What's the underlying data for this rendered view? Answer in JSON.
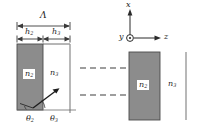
{
  "figure": {
    "colors": {
      "grating_fill": "#8c8c8c",
      "grating_stroke": "#4a4a4a",
      "line": "#3a3a3a",
      "text": "#1c1c1c",
      "background": "#ffffff"
    },
    "dimensions": {
      "period_label": "Λ",
      "ridge_thickness_label": "h",
      "ridge_thickness_sub": "2",
      "groove_thickness_label": "h",
      "groove_thickness_sub": "3"
    },
    "labels": {
      "period": "Λ",
      "h2_base": "h",
      "h2_sub": "2",
      "h3_base": "h",
      "h3_sub": "3",
      "n2_base": "n",
      "n2_sub": "2",
      "n3_base": "n",
      "n3_sub": "3",
      "n2_right_base": "n",
      "n2_right_sub": "2",
      "n3_right_base": "n",
      "n3_right_sub": "3",
      "theta2_base": "θ",
      "theta2_sub": "2",
      "theta3_base": "θ",
      "theta3_sub": "3",
      "axis_x": "x",
      "axis_y": "y",
      "axis_z": "z"
    },
    "axes": {
      "x_direction": "up",
      "z_direction": "right",
      "y_direction": "out-of-page",
      "y_marker": "circle-dot"
    },
    "ellipsis": {
      "rows": 2,
      "dash_count": 6,
      "meaning": "periodic-repetition"
    },
    "regions": [
      {
        "name": "ridge",
        "index_label": "n2",
        "fill": "#8c8c8c"
      },
      {
        "name": "groove",
        "index_label": "n3",
        "fill": "#ffffff"
      }
    ]
  }
}
